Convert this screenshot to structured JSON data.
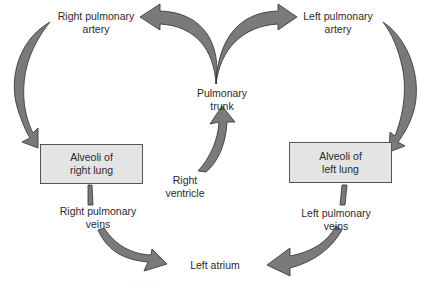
{
  "diagram": {
    "colors": {
      "arrow_fill": "#7a7a7a",
      "arrow_stroke": "#2f2f2f",
      "box_fill": "#e4e4e4",
      "box_border": "#555555",
      "text": "#2b2b2b"
    },
    "nodes": {
      "right_pulmonary_artery": {
        "line1": "Right pulmonary",
        "line2": "artery"
      },
      "left_pulmonary_artery": {
        "line1": "Left pulmonary",
        "line2": "artery"
      },
      "pulmonary_trunk": {
        "line1": "Pulmonary",
        "line2": "trunk"
      },
      "right_ventricle": {
        "line1": "Right",
        "line2": "ventricle"
      },
      "alveoli_right": {
        "line1": "Alveoli of",
        "line2": "right lung"
      },
      "alveoli_left": {
        "line1": "Alveoli of",
        "line2": "left lung"
      },
      "right_pulmonary_veins": {
        "line1": "Right pulmonary",
        "line2": "veins"
      },
      "left_pulmonary_veins": {
        "line1": "Left pulmonary",
        "line2": "veins"
      },
      "left_atrium": {
        "line1": "Left atrium"
      }
    },
    "edges": [
      {
        "from": "Right ventricle",
        "to": "Pulmonary trunk"
      },
      {
        "from": "Pulmonary trunk",
        "to": "Right pulmonary artery"
      },
      {
        "from": "Pulmonary trunk",
        "to": "Left pulmonary artery"
      },
      {
        "from": "Right pulmonary artery",
        "to": "Alveoli of right lung"
      },
      {
        "from": "Left pulmonary artery",
        "to": "Alveoli of left lung"
      },
      {
        "from": "Alveoli of right lung",
        "to": "Right pulmonary veins"
      },
      {
        "from": "Alveoli of left lung",
        "to": "Left pulmonary veins"
      },
      {
        "from": "Right pulmonary veins",
        "to": "Left atrium"
      },
      {
        "from": "Left pulmonary veins",
        "to": "Left atrium"
      }
    ],
    "caption": "· · · ·  ·  · · ·"
  }
}
